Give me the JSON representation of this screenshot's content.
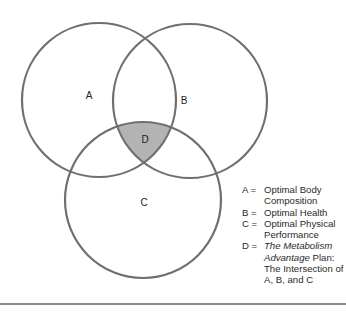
{
  "diagram": {
    "type": "venn",
    "circles": [
      {
        "id": "A",
        "label": "A"
      },
      {
        "id": "B",
        "label": "B"
      },
      {
        "id": "C",
        "label": "C"
      }
    ],
    "intersection": {
      "id": "D",
      "label": "D",
      "of": [
        "A",
        "B",
        "C"
      ],
      "fill_color": "#b3b3b3"
    },
    "stroke_color": "#6f6f6f",
    "legend": [
      {
        "key": "A =",
        "text": "Optimal Body Composition"
      },
      {
        "key": "B =",
        "text": "Optimal Health"
      },
      {
        "key": "C =",
        "text": "Optimal Physical Performance"
      },
      {
        "key": "D =",
        "text_italic": "The Metabolism Advantage",
        "text": " Plan: The Intersection of A, B, and C"
      }
    ]
  }
}
